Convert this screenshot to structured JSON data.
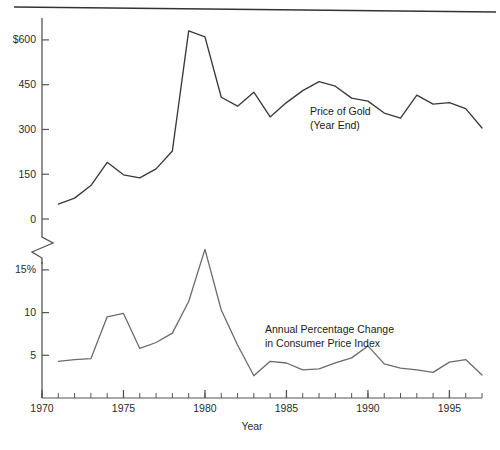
{
  "figure": {
    "top_rule": true,
    "background_color": "#ffffff"
  },
  "chart_data": [
    {
      "type": "line",
      "title": "",
      "series_label": "Price of Gold\n(Year End)",
      "series_label_line1": "Price of Gold",
      "series_label_line2": "(Year End)",
      "line_color": "#3a3a3a",
      "xlabel": "",
      "ylabel": "",
      "ylim": [
        0,
        660
      ],
      "xlim": [
        1970,
        1997
      ],
      "grid": false,
      "legend_position": "inline-annotation",
      "ytick_labels": [
        "$600",
        "450",
        "300",
        "150",
        "0"
      ],
      "ytick_values": [
        600,
        450,
        300,
        150,
        0
      ],
      "x": [
        1971,
        1972,
        1973,
        1974,
        1975,
        1976,
        1977,
        1978,
        1979,
        1980,
        1981,
        1982,
        1983,
        1984,
        1985,
        1986,
        1987,
        1988,
        1989,
        1990,
        1991,
        1992,
        1993,
        1994,
        1995,
        1996,
        1997
      ],
      "values": [
        50,
        70,
        112,
        190,
        148,
        138,
        168,
        228,
        630,
        610,
        408,
        378,
        425,
        342,
        390,
        430,
        460,
        445,
        405,
        395,
        355,
        338,
        415,
        385,
        390,
        370,
        305
      ]
    },
    {
      "type": "line",
      "title": "",
      "series_label": "Annual Percentage Change\nin Consumer Price Index",
      "series_label_line1": "Annual Percentage Change",
      "series_label_line2": "in Consumer Price Index",
      "line_color": "#6b6b6b",
      "xlabel": "Year",
      "ylabel": "",
      "ylim": [
        0,
        18.5
      ],
      "xlim": [
        1970,
        1997
      ],
      "grid": false,
      "legend_position": "inline-annotation",
      "ytick_labels": [
        "15%",
        "10",
        "5"
      ],
      "ytick_values": [
        15,
        10,
        5
      ],
      "x": [
        1971,
        1972,
        1973,
        1974,
        1975,
        1976,
        1977,
        1978,
        1979,
        1980,
        1981,
        1982,
        1983,
        1984,
        1985,
        1986,
        1987,
        1988,
        1989,
        1990,
        1991,
        1992,
        1993,
        1994,
        1995,
        1996,
        1997
      ],
      "values": [
        4.3,
        4.5,
        4.6,
        9.5,
        9.9,
        5.8,
        6.5,
        7.6,
        11.3,
        17.4,
        10.3,
        6.2,
        2.6,
        4.3,
        4.1,
        3.3,
        3.4,
        4.1,
        4.7,
        6.1,
        4.0,
        3.5,
        3.3,
        3.0,
        4.2,
        4.5,
        2.7
      ]
    }
  ],
  "x_axis": {
    "tick_labels": [
      "1970",
      "1975",
      "1980",
      "1985",
      "1990",
      "1995"
    ],
    "tick_values": [
      1970,
      1975,
      1980,
      1985,
      1990,
      1995
    ],
    "minor_tick_step": 1,
    "axis_title": "Year"
  },
  "axis_break": {
    "present": true,
    "description": "zigzag break between upper and lower panels"
  }
}
